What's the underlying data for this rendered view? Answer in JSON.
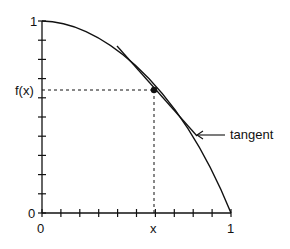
{
  "diagram": {
    "y_axis": {
      "top_label": "1",
      "bottom_label": "0",
      "marked_value_label": "f(x)"
    },
    "x_axis": {
      "left_label": "0",
      "right_label": "1",
      "marked_value_label": "x"
    },
    "annotation": {
      "label": "tangent",
      "arrow": "left-arrow"
    },
    "x_ticks": 10,
    "y_ticks": 10,
    "colors": {
      "line": "#111111",
      "background": "#ffffff"
    }
  }
}
